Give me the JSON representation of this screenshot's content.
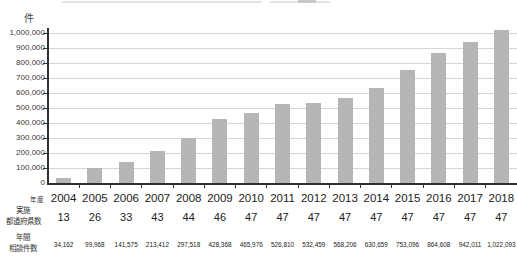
{
  "unit_label": "件",
  "colors": {
    "bar": "#b6b6b6",
    "grid": "#d6d6d6",
    "axis": "#2f2f2f",
    "text": "#333333"
  },
  "chart_data": {
    "type": "bar",
    "categories": [
      "2004",
      "2005",
      "2006",
      "2007",
      "2008",
      "2009",
      "2010",
      "2011",
      "2012",
      "2013",
      "2014",
      "2015",
      "2016",
      "2017",
      "2018"
    ],
    "values": [
      34162,
      99968,
      141575,
      213412,
      297518,
      428368,
      465976,
      526810,
      532459,
      568206,
      630659,
      753096,
      864608,
      942011,
      1022093
    ],
    "title": "",
    "xlabel": "年度",
    "ylabel": "件",
    "ylim": [
      0,
      1000000
    ],
    "ytick_step": 100000,
    "ytick_labels": [
      "0",
      "100,000",
      "200,000",
      "300,000",
      "400,000",
      "500,000",
      "600,000",
      "700,000",
      "800,000",
      "900,000",
      "1,000,000"
    ],
    "grid": true,
    "legend": "none"
  },
  "table": {
    "row_year": {
      "label": "年度",
      "values": [
        "2004",
        "2005",
        "2006",
        "2007",
        "2008",
        "2009",
        "2010",
        "2011",
        "2012",
        "2013",
        "2014",
        "2015",
        "2016",
        "2017",
        "2018"
      ]
    },
    "row_prefectures": {
      "label_line1": "実施",
      "label_line2": "都道府県数",
      "values": [
        "13",
        "26",
        "33",
        "43",
        "44",
        "46",
        "47",
        "47",
        "47",
        "47",
        "47",
        "47",
        "47",
        "47",
        "47"
      ]
    },
    "row_consultations": {
      "label_line1": "年間",
      "label_line2": "相談件数",
      "values": [
        "34,162",
        "99,968",
        "141,575",
        "213,412",
        "297,518",
        "428,368",
        "465,976",
        "526,810",
        "532,459",
        "568,206",
        "630,659",
        "753,096",
        "864,608",
        "942,011",
        "1,022,093"
      ]
    }
  }
}
